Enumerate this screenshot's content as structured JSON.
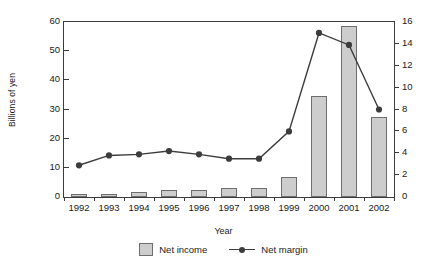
{
  "chart_data": {
    "type": "bar",
    "title": "",
    "xlabel": "Year",
    "ylabel": "Billions of yen",
    "y2label": "",
    "categories": [
      "1992",
      "1993",
      "1994",
      "1995",
      "1996",
      "1997",
      "1998",
      "1999",
      "2000",
      "2001",
      "2002"
    ],
    "ylim": [
      0,
      60
    ],
    "yticks": [
      0,
      10,
      20,
      30,
      40,
      50,
      60
    ],
    "y2lim": [
      0,
      16
    ],
    "y2ticks": [
      0,
      2,
      4,
      6,
      8,
      10,
      12,
      14,
      16
    ],
    "grid": false,
    "legend_position": "bottom-center",
    "series": [
      {
        "name": "Net income",
        "kind": "bar",
        "axis": "left",
        "color": "#cdcdcd",
        "edge_color": "#6e6e6e",
        "values": [
          1.2,
          1.2,
          1.7,
          2.3,
          2.3,
          3.0,
          3.0,
          7.0,
          34.5,
          58.5,
          27.5
        ]
      },
      {
        "name": "Net margin",
        "kind": "line",
        "axis": "right",
        "color": "#3c3c3c",
        "marker": "circle",
        "values": [
          2.9,
          3.8,
          3.9,
          4.2,
          3.9,
          3.5,
          3.5,
          6.0,
          15.0,
          13.9,
          8.0
        ]
      }
    ]
  },
  "axes": {
    "y_title": "Billions of yen",
    "x_title": "Year",
    "y_tick_labels": [
      "0",
      "10",
      "20",
      "30",
      "40",
      "50",
      "60"
    ],
    "y2_tick_labels": [
      "0",
      "2",
      "4",
      "6",
      "8",
      "10",
      "12",
      "14",
      "16"
    ],
    "x_tick_labels": [
      "1992",
      "1993",
      "1994",
      "1995",
      "1996",
      "1997",
      "1998",
      "1999",
      "2000",
      "2001",
      "2002"
    ]
  },
  "legend": {
    "items": [
      {
        "label": "Net income",
        "type": "swatch"
      },
      {
        "label": "Net margin",
        "type": "line-marker"
      }
    ]
  }
}
